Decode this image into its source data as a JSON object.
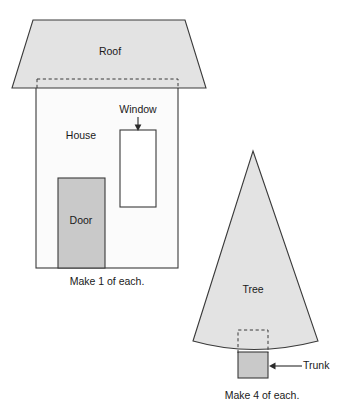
{
  "page": {
    "background_color": "#ffffff",
    "width": 338,
    "height": 411
  },
  "colors": {
    "outline": "#3a3a3a",
    "fill_light_gray": "#e3e3e3",
    "fill_mid_gray": "#c9c9c9",
    "fill_white": "#fbfbfb",
    "text": "#1a1a1a"
  },
  "house_group": {
    "caption": "Make 1 of each.",
    "parts": {
      "roof": {
        "label": "Roof",
        "fill": "#e3e3e3",
        "shape": "trapezoid",
        "points": "33,20 185,20 206,88 12,88"
      },
      "body": {
        "label": "House",
        "fill": "#fbfbfb",
        "shape": "rectangle",
        "x": 36,
        "y": 79,
        "width": 142,
        "height": 189
      },
      "window": {
        "label": "Window",
        "fill": "#ffffff",
        "shape": "rectangle",
        "x": 120,
        "y": 130,
        "width": 36,
        "height": 77
      },
      "door": {
        "label": "Door",
        "fill": "#c9c9c9",
        "shape": "rectangle",
        "x": 58,
        "y": 178,
        "width": 47,
        "height": 90
      },
      "roof_overlap_guide": {
        "label": "roof seam allowance guide",
        "style": "dashed",
        "x": 37,
        "y": 79,
        "width": 141,
        "height": 10
      }
    }
  },
  "tree_group": {
    "caption": "Make 4 of each.",
    "parts": {
      "tree": {
        "label": "Tree",
        "fill": "#e3e3e3",
        "shape": "triangle-with-curved-base",
        "apex_x": 253,
        "apex_y": 151,
        "base_left_x": 193,
        "base_right_x": 318,
        "base_y": 348
      },
      "trunk": {
        "label": "Trunk",
        "fill": "#c9c9c9",
        "shape": "rectangle",
        "x": 238,
        "y": 354,
        "width": 30,
        "height": 24
      },
      "trunk_hidden_guide": {
        "label": "trunk seam allowance guide",
        "style": "dashed",
        "x": 238,
        "y": 330,
        "width": 30,
        "height": 24
      }
    }
  },
  "annotations": {
    "window_callout": {
      "label": "Window",
      "label_x": 138,
      "label_y": 110,
      "arrow_from_x": 138,
      "arrow_from_y": 117,
      "arrow_to_x": 138,
      "arrow_to_y": 130,
      "direction": "down"
    },
    "trunk_callout": {
      "label": "Trunk",
      "label_x": 284,
      "label_y": 366,
      "arrow_from_x": 302,
      "arrow_from_y": 366,
      "arrow_to_x": 269,
      "arrow_to_y": 366,
      "direction": "left"
    }
  }
}
